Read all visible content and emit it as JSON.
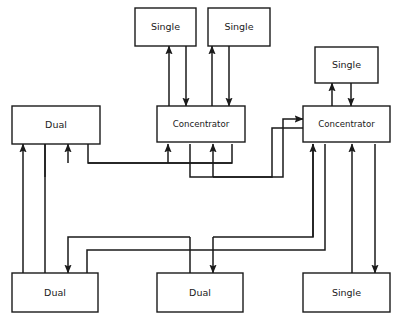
{
  "diagram": {
    "type": "node-link-diagram",
    "canvas": {
      "width": 398,
      "height": 320
    },
    "colors": {
      "background": "#ffffff",
      "stroke": "#1a1a1a",
      "box_fill": "#ffffff"
    },
    "nodes": [
      {
        "id": "single-top-left",
        "label": "Single",
        "x": 135,
        "y": 8,
        "w": 61,
        "h": 38,
        "size": "normal"
      },
      {
        "id": "single-top-mid",
        "label": "Single",
        "x": 208,
        "y": 8,
        "w": 62,
        "h": 38,
        "size": "normal"
      },
      {
        "id": "single-top-right",
        "label": "Single",
        "x": 315,
        "y": 47,
        "w": 63,
        "h": 36,
        "size": "normal"
      },
      {
        "id": "dual-left",
        "label": "Dual",
        "x": 12,
        "y": 106,
        "w": 88,
        "h": 38,
        "size": "normal"
      },
      {
        "id": "concentrator-left",
        "label": "Concentrator",
        "x": 157,
        "y": 106,
        "w": 88,
        "h": 36,
        "size": "small"
      },
      {
        "id": "concentrator-right",
        "label": "Concentrator",
        "x": 303,
        "y": 106,
        "w": 87,
        "h": 36,
        "size": "small"
      },
      {
        "id": "dual-bottom-left",
        "label": "Dual",
        "x": 12,
        "y": 273,
        "w": 86,
        "h": 39,
        "size": "normal"
      },
      {
        "id": "dual-bottom-mid",
        "label": "Dual",
        "x": 157,
        "y": 273,
        "w": 86,
        "h": 39,
        "size": "normal"
      },
      {
        "id": "single-bottom-right",
        "label": "Single",
        "x": 303,
        "y": 273,
        "w": 87,
        "h": 39,
        "size": "normal"
      }
    ],
    "links": [
      {
        "id": "conc-left-to-single-top-left",
        "from": "concentrator-left",
        "to": "single-top-left",
        "path": "M 169,106 L 169,46",
        "arrow": "end"
      },
      {
        "id": "single-top-left-to-conc-left",
        "from": "single-top-left",
        "to": "concentrator-left",
        "path": "M 186,46 L 186,106",
        "arrow": "end"
      },
      {
        "id": "conc-left-to-single-top-mid",
        "from": "concentrator-left",
        "to": "single-top-mid",
        "path": "M 212,106 L 212,46",
        "arrow": "end"
      },
      {
        "id": "single-top-mid-to-conc-left",
        "from": "single-top-mid",
        "to": "concentrator-left",
        "path": "M 229,46 L 229,106",
        "arrow": "end"
      },
      {
        "id": "conc-right-to-single-top-right",
        "from": "concentrator-right",
        "to": "single-top-right",
        "path": "M 332,106 L 332,83",
        "arrow": "end"
      },
      {
        "id": "single-top-right-to-conc-right",
        "from": "single-top-right",
        "to": "concentrator-right",
        "path": "M 351,83 L 351,106",
        "arrow": "end"
      },
      {
        "id": "dual-left-to-conc-left",
        "from": "dual-left",
        "to": "concentrator-left",
        "path": "M 88,144 L 88,163 L 232,163",
        "arrow": "none"
      },
      {
        "id": "conc-left-to-dual-left",
        "from": "concentrator-left",
        "to": "dual-left",
        "path": "M 232,144 L 232,163 L 88,163",
        "arrow": "none"
      },
      {
        "id": "rail-upper-into-conc-left",
        "from": "rail-upper",
        "to": "concentrator-left",
        "path": "M 168,163 L 168,144",
        "arrow": "end"
      },
      {
        "id": "rail-upper-into-dual-left",
        "from": "rail-upper",
        "to": "dual-left",
        "path": "M 68,163 L 68,144",
        "arrow": "end"
      },
      {
        "id": "conc-left-to-conc-right",
        "from": "concentrator-left",
        "to": "concentrator-right",
        "path": "M 190,144 L 190,177 L 283,177 L 283,119 L 303,119",
        "arrow": "end"
      },
      {
        "id": "conc-right-to-conc-left",
        "from": "concentrator-right",
        "to": "concentrator-left",
        "path": "M 303,128 L 272,128 L 272,177 L 213,177",
        "arrow": "none"
      },
      {
        "id": "rail-lower-into-conc-left",
        "from": "rail-lower",
        "to": "concentrator-left",
        "path": "M 213,177 L 213,144",
        "arrow": "end"
      },
      {
        "id": "rail-lower-into-dual-left",
        "from": "rail-lower",
        "to": "dual-left",
        "path": "M 45,177 L 45,144",
        "arrow": "none"
      },
      {
        "id": "dual-left-lower-trunk",
        "from": "dual-left",
        "to": "dual-bottom-left",
        "path": "M 45,144 L 45,273",
        "arrow": "none"
      },
      {
        "id": "dual-bottom-left-to-dual-left",
        "from": "dual-bottom-left",
        "to": "dual-left",
        "path": "M 23,273 L 23,144",
        "arrow": "end"
      },
      {
        "id": "conc-right-to-dual-bottom-left",
        "from": "concentrator-right",
        "to": "dual-bottom-left",
        "path": "M 325,144 L 325,250 L 87,250 L 87,273",
        "arrow": "none"
      },
      {
        "id": "rail-mid-upper-to-dual-left",
        "from": "rail-mid-upper",
        "to": "dual-bottom-left",
        "path": "M 190,237 L 68,237 L 68,273",
        "arrow": "end"
      },
      {
        "id": "dual-bottom-mid-trunk-up",
        "from": "dual-bottom-mid",
        "to": "concentrator-left",
        "path": "M 190,273 L 190,237",
        "arrow": "none"
      },
      {
        "id": "rail-mid-lower-to-dual-mid",
        "from": "rail-mid-lower",
        "to": "dual-bottom-mid",
        "path": "M 213,237 L 213,273",
        "arrow": "end"
      },
      {
        "id": "conc-right-trunk-down",
        "from": "concentrator-right",
        "to": "dual-bottom-mid",
        "path": "M 313,144 L 313,237 L 213,237",
        "arrow": "none"
      },
      {
        "id": "dual-bottom-mid-to-conc-right",
        "from": "dual-bottom-mid",
        "to": "concentrator-right",
        "path": "M 313,237 L 313,144",
        "arrow": "end"
      },
      {
        "id": "single-bottom-to-conc-right",
        "from": "single-bottom-right",
        "to": "concentrator-right",
        "path": "M 352,273 L 352,144",
        "arrow": "end"
      },
      {
        "id": "conc-right-to-single-bottom",
        "from": "concentrator-right",
        "to": "single-bottom-right",
        "path": "M 375,144 L 375,273",
        "arrow": "end"
      }
    ]
  }
}
